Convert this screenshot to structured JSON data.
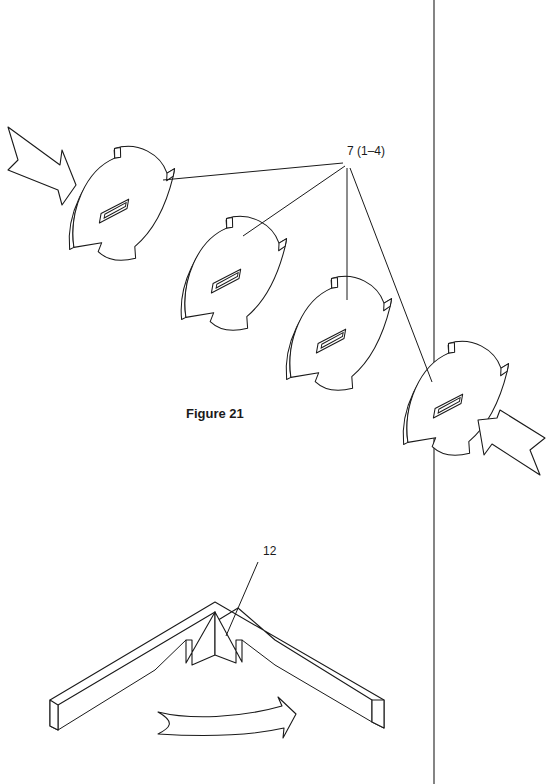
{
  "figure": {
    "caption": "Figure 21",
    "divider_color": "#333333",
    "ink_color": "#1a1a1a",
    "background": "#ffffff"
  },
  "labels": {
    "discs_ref": "7 (1–4)",
    "corner_ref": "12"
  },
  "parts": {
    "discs": [
      {
        "id": "disc-1",
        "cx": 120,
        "cy": 200
      },
      {
        "id": "disc-2",
        "cx": 230,
        "cy": 270
      },
      {
        "id": "disc-3",
        "cx": 335,
        "cy": 330
      },
      {
        "id": "disc-4",
        "cx": 455,
        "cy": 400
      }
    ],
    "arrows": [
      {
        "id": "arrow-in-top-left",
        "direction": "down-right"
      },
      {
        "id": "arrow-out-right",
        "direction": "up-right"
      },
      {
        "id": "arrow-curved-bottom",
        "direction": "right"
      }
    ],
    "corner_piece": {
      "id": "v-shaped-strip"
    }
  }
}
